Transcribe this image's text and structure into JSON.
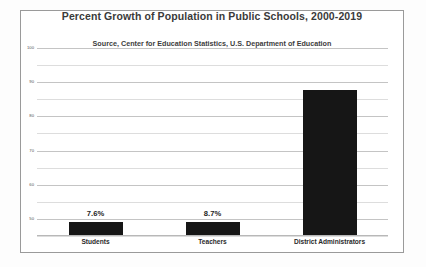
{
  "chart_data": {
    "type": "bar",
    "title": "Percent Growth of Population in Public Schools, 2000-2019",
    "subtitle": "Source, Center for Education Statistics, U.S. Department of Education",
    "xlabel": "",
    "ylabel": "",
    "categories": [
      "Students",
      "Teachers",
      "District Administrators"
    ],
    "values": [
      7.6,
      8.7,
      87.6
    ],
    "data_labels": [
      "7.6%",
      "8.7%",
      ""
    ],
    "ylim": [
      0,
      100
    ],
    "yticks": [
      50,
      60,
      70,
      80,
      90,
      100
    ],
    "ytick_labels": [
      "50",
      "60",
      "70",
      "80",
      "90",
      "100"
    ],
    "minor_gridlines": true,
    "grid": true,
    "legend": "none",
    "bar_color": "#161616",
    "gridline_color": "#c4c4c4"
  },
  "frame": {
    "border_color": "#9a9a9a",
    "background": "#ffffff"
  }
}
